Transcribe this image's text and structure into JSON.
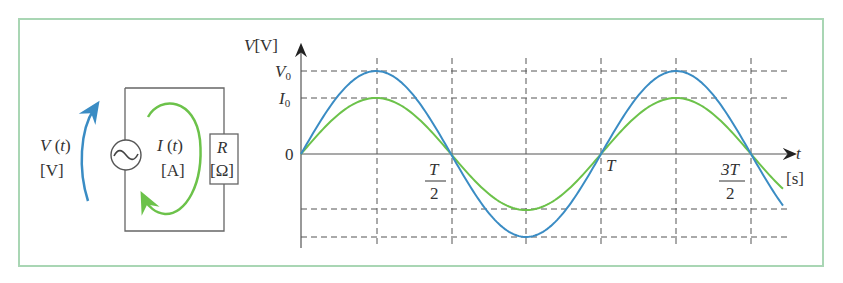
{
  "circuit": {
    "voltage_label": "V(t)",
    "voltage_unit": "[V]",
    "current_label": "I(t)",
    "current_unit": "[A]",
    "resistor_label": "R",
    "resistor_unit": "[Ω]",
    "source_symbol": "~"
  },
  "graph": {
    "y_axis_label": "V[V]",
    "x_axis_label": "t",
    "x_axis_unit": "[s]",
    "origin_label": "0",
    "v0_label": "V",
    "v0_sub": "0",
    "i0_label": "I",
    "i0_sub": "0",
    "t_half_num": "T",
    "t_half_den": "2",
    "t_label": "T",
    "t_3half_num": "3T",
    "t_3half_den": "2"
  },
  "colors": {
    "voltage": "#3a8cc4",
    "current": "#6cc24a",
    "frame": "#a9d6b4"
  },
  "chart_data": {
    "type": "line",
    "title": "",
    "xlabel": "t [s]",
    "ylabel": "V [V]",
    "x_ticks": [
      "0",
      "T/2",
      "T",
      "3T/2"
    ],
    "y_ticks": [
      "0",
      "I0",
      "V0"
    ],
    "series": [
      {
        "name": "V(t)",
        "color": "#3a8cc4",
        "function": "V0·sin(2πt/T)",
        "amplitude": "V0"
      },
      {
        "name": "I(t)",
        "color": "#6cc24a",
        "function": "I0·sin(2πt/T)",
        "amplitude": "I0"
      }
    ],
    "x_range": [
      0,
      1.6
    ],
    "grid": "dashed at T/4 intervals and at ±V0, ±I0"
  }
}
